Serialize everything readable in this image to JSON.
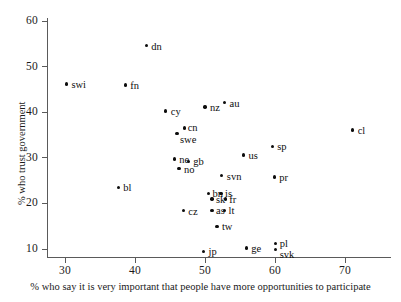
{
  "chart_data": {
    "type": "scatter",
    "title": "",
    "xlabel": "% who say it is very important that people have more opportunities to participate",
    "ylabel": "% who trust government",
    "xlim": [
      26,
      74
    ],
    "ylim": [
      6.5,
      62
    ],
    "xticks": [
      30,
      40,
      50,
      60,
      70
    ],
    "yticks": [
      10,
      20,
      30,
      40,
      50,
      60
    ],
    "grid": false,
    "legend": "none",
    "points": [
      {
        "label": "swi",
        "x": 30.2,
        "y": 46.2,
        "lx": 5,
        "ly": -4
      },
      {
        "label": "fn",
        "x": 38.6,
        "y": 46.0,
        "lx": 5,
        "ly": -4
      },
      {
        "label": "dn",
        "x": 41.6,
        "y": 54.6,
        "lx": 5,
        "ly": -4
      },
      {
        "label": "bl",
        "x": 37.6,
        "y": 23.5,
        "lx": 5,
        "ly": -4
      },
      {
        "label": "cy",
        "x": 44.4,
        "y": 40.3,
        "lx": 5,
        "ly": -4
      },
      {
        "label": "swe",
        "x": 46.0,
        "y": 35.3,
        "lx": 3,
        "ly": 1
      },
      {
        "label": "cn",
        "x": 47.1,
        "y": 36.5,
        "lx": 3,
        "ly": -5
      },
      {
        "label": "nz",
        "x": 50.0,
        "y": 41.1,
        "lx": 5,
        "ly": -4
      },
      {
        "label": "au",
        "x": 52.8,
        "y": 42.1,
        "lx": 5,
        "ly": -4
      },
      {
        "label": "ne",
        "x": 45.6,
        "y": 29.7,
        "lx": 5,
        "ly": -4
      },
      {
        "label": "gb",
        "x": 47.6,
        "y": 29.2,
        "lx": 5,
        "ly": -4
      },
      {
        "label": "no",
        "x": 46.3,
        "y": 27.6,
        "lx": 5,
        "ly": -4
      },
      {
        "label": "us",
        "x": 55.5,
        "y": 30.6,
        "lx": 5,
        "ly": -4
      },
      {
        "label": "sp",
        "x": 59.6,
        "y": 32.5,
        "lx": 5,
        "ly": -4
      },
      {
        "label": "svn",
        "x": 52.4,
        "y": 26.1,
        "lx": 5,
        "ly": -4
      },
      {
        "label": "pr",
        "x": 59.9,
        "y": 25.8,
        "lx": 5,
        "ly": -4
      },
      {
        "label": "bn",
        "x": 50.5,
        "y": 22.2,
        "lx": 4,
        "ly": -4
      },
      {
        "label": "is",
        "x": 52.3,
        "y": 22.2,
        "lx": 4,
        "ly": -4
      },
      {
        "label": "sk",
        "x": 51.0,
        "y": 21.0,
        "lx": 4,
        "ly": -4
      },
      {
        "label": "fr",
        "x": 52.9,
        "y": 21.0,
        "lx": 4,
        "ly": -4
      },
      {
        "label": "as",
        "x": 51.0,
        "y": 18.5,
        "lx": 4,
        "ly": -4
      },
      {
        "label": "lt",
        "x": 52.8,
        "y": 18.5,
        "lx": 4,
        "ly": -4
      },
      {
        "label": "cz",
        "x": 46.9,
        "y": 18.4,
        "lx": 5,
        "ly": -4
      },
      {
        "label": "tw",
        "x": 51.7,
        "y": 15.0,
        "lx": 5,
        "ly": -4
      },
      {
        "label": "jp",
        "x": 49.8,
        "y": 9.5,
        "lx": 5,
        "ly": -4
      },
      {
        "label": "ge",
        "x": 55.9,
        "y": 10.2,
        "lx": 5,
        "ly": -4
      },
      {
        "label": "pl",
        "x": 60.1,
        "y": 11.2,
        "lx": 4,
        "ly": -5
      },
      {
        "label": "svk",
        "x": 60.1,
        "y": 9.9,
        "lx": 4,
        "ly": 1
      },
      {
        "label": "cl",
        "x": 71.1,
        "y": 36.1,
        "lx": 5,
        "ly": -4
      }
    ]
  }
}
